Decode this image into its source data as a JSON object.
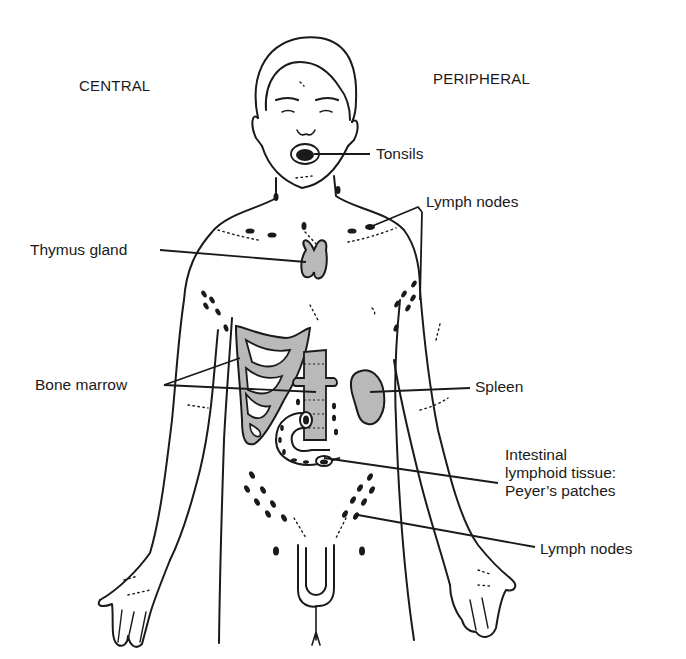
{
  "figure": {
    "headings": {
      "central": "CENTRAL",
      "peripheral": "PERIPHERAL"
    },
    "labels": {
      "tonsils": "Tonsils",
      "lymph_nodes_upper": "Lymph nodes",
      "thymus": "Thymus gland",
      "bone_marrow": "Bone marrow",
      "spleen": "Spleen",
      "intestinal_line1": "Intestinal",
      "intestinal_line2": "lymphoid tissue:",
      "intestinal_line3": "Peyer’s patches",
      "lymph_nodes_lower": "Lymph nodes"
    },
    "colors": {
      "ink": "#1a1a1a",
      "organ_fill": "#b9b9b9",
      "background": "#ffffff"
    }
  }
}
